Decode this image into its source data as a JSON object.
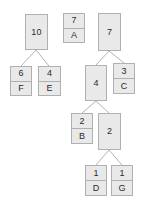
{
  "diagram": {
    "type": "binary-tree",
    "canvas": {
      "width": 147,
      "height": 208
    },
    "style": {
      "node_fill": "#e9e9e9",
      "node_border": "#b0b0b0",
      "edge_color": "#b3b3b3",
      "text_color": "#2b2b2b",
      "background": "#ffffff"
    },
    "nodes": [
      {
        "id": "n10",
        "weight": "10",
        "symbol": "",
        "split": false,
        "x": 25,
        "y": 14,
        "w": 23,
        "h": 36
      },
      {
        "id": "n6F",
        "weight": "6",
        "symbol": "F",
        "split": true,
        "x": 10,
        "y": 66,
        "w": 22,
        "h": 30
      },
      {
        "id": "n4E",
        "weight": "4",
        "symbol": "E",
        "split": true,
        "x": 38,
        "y": 66,
        "w": 23,
        "h": 30
      },
      {
        "id": "n7A",
        "weight": "7",
        "symbol": "A",
        "split": true,
        "x": 63,
        "y": 13,
        "w": 22,
        "h": 30
      },
      {
        "id": "n7",
        "weight": "7",
        "symbol": "",
        "split": false,
        "x": 98,
        "y": 13,
        "w": 23,
        "h": 38
      },
      {
        "id": "n4",
        "weight": "4",
        "symbol": "",
        "split": false,
        "x": 85,
        "y": 65,
        "w": 22,
        "h": 36
      },
      {
        "id": "n3C",
        "weight": "3",
        "symbol": "C",
        "split": true,
        "x": 113,
        "y": 63,
        "w": 22,
        "h": 31
      },
      {
        "id": "n2B",
        "weight": "2",
        "symbol": "B",
        "split": true,
        "x": 71,
        "y": 113,
        "w": 22,
        "h": 31
      },
      {
        "id": "n2",
        "weight": "2",
        "symbol": "",
        "split": false,
        "x": 98,
        "y": 113,
        "w": 23,
        "h": 37
      },
      {
        "id": "n1D",
        "weight": "1",
        "symbol": "D",
        "split": true,
        "x": 85,
        "y": 165,
        "w": 22,
        "h": 31
      },
      {
        "id": "n1G",
        "weight": "1",
        "symbol": "G",
        "split": true,
        "x": 111,
        "y": 165,
        "w": 22,
        "h": 31
      }
    ],
    "edges": [
      {
        "from": "n10",
        "to": "n6F",
        "x1": 36,
        "y1": 50,
        "x2": 21,
        "y2": 66
      },
      {
        "from": "n10",
        "to": "n4E",
        "x1": 36,
        "y1": 50,
        "x2": 49,
        "y2": 66
      },
      {
        "from": "n7",
        "to": "n4",
        "x1": 109,
        "y1": 51,
        "x2": 96,
        "y2": 65
      },
      {
        "from": "n7",
        "to": "n3C",
        "x1": 109,
        "y1": 51,
        "x2": 124,
        "y2": 63
      },
      {
        "from": "n4",
        "to": "n2B",
        "x1": 96,
        "y1": 101,
        "x2": 82,
        "y2": 113
      },
      {
        "from": "n4",
        "to": "n2",
        "x1": 96,
        "y1": 101,
        "x2": 109,
        "y2": 113
      },
      {
        "from": "n2",
        "to": "n1D",
        "x1": 109,
        "y1": 150,
        "x2": 96,
        "y2": 165
      },
      {
        "from": "n2",
        "to": "n1G",
        "x1": 109,
        "y1": 150,
        "x2": 122,
        "y2": 165
      }
    ]
  }
}
